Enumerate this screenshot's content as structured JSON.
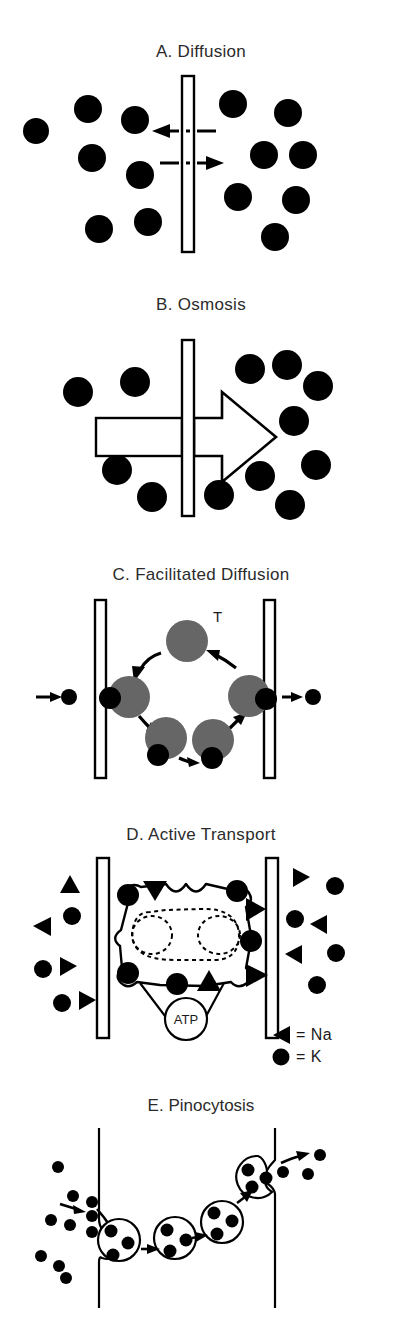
{
  "figure": {
    "background": "#ffffff",
    "ink": "#000000",
    "title_color": "#2b2b2b",
    "carrier_fill": "#666666"
  },
  "panels": [
    {
      "id": "a",
      "title": "A.  Diffusion",
      "membrane": {
        "type": "single-bar",
        "x": 182,
        "y": 76,
        "w": 12,
        "h": 176
      },
      "arrows": [
        {
          "name": "leftward-dashed-arrow",
          "direction": "left",
          "label": ""
        },
        {
          "name": "rightward-dashed-arrow",
          "direction": "right",
          "label": ""
        }
      ],
      "left_particles": [
        {
          "cx": 36,
          "cy": 131,
          "r": 13
        },
        {
          "cx": 88,
          "cy": 109,
          "r": 14
        },
        {
          "cx": 135,
          "cy": 120,
          "r": 14
        },
        {
          "cx": 92,
          "cy": 158,
          "r": 14
        },
        {
          "cx": 140,
          "cy": 175,
          "r": 14
        },
        {
          "cx": 99,
          "cy": 229,
          "r": 14
        },
        {
          "cx": 148,
          "cy": 222,
          "r": 14
        }
      ],
      "right_particles": [
        {
          "cx": 233,
          "cy": 104,
          "r": 14
        },
        {
          "cx": 288,
          "cy": 113,
          "r": 14
        },
        {
          "cx": 264,
          "cy": 155,
          "r": 14
        },
        {
          "cx": 303,
          "cy": 155,
          "r": 14
        },
        {
          "cx": 238,
          "cy": 197,
          "r": 14
        },
        {
          "cx": 296,
          "cy": 200,
          "r": 14
        },
        {
          "cx": 275,
          "cy": 237,
          "r": 14
        }
      ]
    },
    {
      "id": "b",
      "title": "B.  Osmosis",
      "membrane": {
        "type": "single-bar",
        "x": 182,
        "y": 340,
        "w": 12,
        "h": 176
      },
      "flow_arrow": {
        "name": "osmosis-flow-arrow",
        "direction": "right",
        "style": "outline"
      },
      "tail_rect": {
        "name": "osmosis-arrow-tail",
        "style": "outline"
      },
      "left_particles": [
        {
          "cx": 78,
          "cy": 392,
          "r": 15
        },
        {
          "cx": 135,
          "cy": 382,
          "r": 15
        },
        {
          "cx": 117,
          "cy": 470,
          "r": 15
        },
        {
          "cx": 152,
          "cy": 497,
          "r": 15
        }
      ],
      "right_particles": [
        {
          "cx": 250,
          "cy": 369,
          "r": 15
        },
        {
          "cx": 287,
          "cy": 365,
          "r": 15
        },
        {
          "cx": 318,
          "cy": 386,
          "r": 15
        },
        {
          "cx": 294,
          "cy": 421,
          "r": 15
        },
        {
          "cx": 316,
          "cy": 465,
          "r": 15
        },
        {
          "cx": 260,
          "cy": 476,
          "r": 15
        },
        {
          "cx": 219,
          "cy": 495,
          "r": 15
        },
        {
          "cx": 290,
          "cy": 505,
          "r": 15
        }
      ]
    },
    {
      "id": "c",
      "title": "C.  Facilitated Diffusion",
      "carrier_label": "T",
      "membranes": [
        {
          "name": "left-membrane",
          "x": 95,
          "y": 600,
          "w": 11,
          "h": 178
        },
        {
          "name": "right-membrane",
          "x": 264,
          "y": 600,
          "w": 11,
          "h": 178
        }
      ],
      "carriers": [
        {
          "name": "carrier-top",
          "cx": 187,
          "cy": 641,
          "r": 21,
          "cargo": null
        },
        {
          "name": "carrier-left",
          "cx": 129,
          "cy": 697,
          "r": 21,
          "cargo": "left"
        },
        {
          "name": "carrier-bottom-left",
          "cx": 166,
          "cy": 738,
          "r": 21,
          "cargo": "bottom-left"
        },
        {
          "name": "carrier-bottom-right",
          "cx": 213,
          "cy": 740,
          "r": 21,
          "cargo": "bottom-right"
        },
        {
          "name": "carrier-right",
          "cx": 249,
          "cy": 696,
          "r": 21,
          "cargo": "right"
        }
      ],
      "entry_particle": {
        "cx": 69,
        "cy": 697,
        "r": 8
      },
      "exit_particle": {
        "cx": 310,
        "cy": 697,
        "r": 8
      },
      "entry_arrow": "rightward-arrow",
      "exit_arrow": "rightward-arrow"
    },
    {
      "id": "d",
      "title": "D.  Active Transport",
      "atp_label": "ATP",
      "membranes": [
        {
          "name": "left-membrane",
          "x": 97,
          "y": 858,
          "w": 12,
          "h": 180
        },
        {
          "name": "right-membrane",
          "x": 266,
          "y": 858,
          "w": 12,
          "h": 180
        }
      ],
      "legend": [
        {
          "symbol": "triangle-left",
          "text": "= Na"
        },
        {
          "symbol": "circle",
          "text": "= K"
        }
      ],
      "left_particles": [
        {
          "type": "triangle",
          "cx": 70,
          "cy": 885,
          "rot": 0
        },
        {
          "type": "circle",
          "cx": 72,
          "cy": 915,
          "r": 9
        },
        {
          "type": "triangle",
          "cx": 41,
          "cy": 925,
          "rot": -90
        },
        {
          "type": "circle",
          "cx": 43,
          "cy": 968,
          "r": 9
        },
        {
          "type": "triangle",
          "cx": 67,
          "cy": 965,
          "rot": 90
        },
        {
          "type": "circle",
          "cx": 63,
          "cy": 1001,
          "r": 9
        },
        {
          "type": "triangle",
          "cx": 85,
          "cy": 1000,
          "rot": 90
        }
      ],
      "right_particles": [
        {
          "type": "triangle",
          "cx": 300,
          "cy": 878,
          "rot": 90
        },
        {
          "type": "circle",
          "cx": 333,
          "cy": 885,
          "r": 9
        },
        {
          "type": "circle",
          "cx": 295,
          "cy": 918,
          "r": 9
        },
        {
          "type": "triangle",
          "cx": 318,
          "cy": 923,
          "rot": -90
        },
        {
          "type": "triangle",
          "cx": 292,
          "cy": 953,
          "rot": -90
        },
        {
          "type": "circle",
          "cx": 334,
          "cy": 952,
          "r": 9
        },
        {
          "type": "circle",
          "cx": 315,
          "cy": 983,
          "r": 9
        }
      ],
      "pump_markers": [
        {
          "type": "triangle-down",
          "name": "na-entering-marker"
        },
        {
          "type": "circle",
          "name": "k-marker-top-left"
        },
        {
          "type": "circle",
          "name": "k-marker-top-right"
        },
        {
          "type": "triangle-right",
          "name": "na-exit-marker-upper"
        },
        {
          "type": "circle",
          "name": "k-marker-right"
        },
        {
          "type": "triangle-right",
          "name": "na-exit-marker-lower"
        },
        {
          "type": "circle",
          "name": "k-marker-left-upper"
        },
        {
          "type": "circle",
          "name": "k-marker-left-lower"
        },
        {
          "type": "circle",
          "name": "k-marker-bottom"
        },
        {
          "type": "triangle-up",
          "name": "na-marker-bottom"
        }
      ]
    },
    {
      "id": "e",
      "title": "E. Pinocytosis",
      "membranes": [
        {
          "name": "left-membrane",
          "x": 98,
          "y": 1128,
          "w": 2,
          "h": 180
        },
        {
          "name": "right-membrane",
          "x": 275,
          "y": 1128,
          "w": 2,
          "h": 180
        }
      ],
      "outside_particles_left": [
        {
          "cx": 58,
          "cy": 1167,
          "r": 6
        },
        {
          "cx": 73,
          "cy": 1196,
          "r": 6
        },
        {
          "cx": 92,
          "cy": 1202,
          "r": 6
        },
        {
          "cx": 51,
          "cy": 1220,
          "r": 6
        },
        {
          "cx": 70,
          "cy": 1225,
          "r": 6
        },
        {
          "cx": 92,
          "cy": 1216,
          "r": 6
        },
        {
          "cx": 92,
          "cy": 1232,
          "r": 6
        },
        {
          "cx": 41,
          "cy": 1256,
          "r": 6
        },
        {
          "cx": 59,
          "cy": 1266,
          "r": 6
        },
        {
          "cx": 66,
          "cy": 1278,
          "r": 6
        }
      ],
      "outside_particles_right": [
        {
          "cx": 283,
          "cy": 1172,
          "r": 6
        },
        {
          "cx": 320,
          "cy": 1155,
          "r": 6
        },
        {
          "cx": 308,
          "cy": 1174,
          "r": 6
        }
      ],
      "vesicles": [
        {
          "name": "vesicle-forming",
          "cx": 119,
          "cy": 1240,
          "r": 21,
          "dots": 3
        },
        {
          "name": "vesicle-mid-left",
          "cx": 175,
          "cy": 1238,
          "r": 21,
          "dots": 3
        },
        {
          "name": "vesicle-mid-right",
          "cx": 222,
          "cy": 1222,
          "r": 21,
          "dots": 3
        },
        {
          "name": "vesicle-releasing",
          "cx": 258,
          "cy": 1177,
          "r": 21,
          "dots": 3
        }
      ],
      "arrows": [
        "intake-arrow",
        "invagination-arrow",
        "transit-arrow-1",
        "transit-arrow-2",
        "transit-arrow-3",
        "release-arrow"
      ]
    }
  ]
}
